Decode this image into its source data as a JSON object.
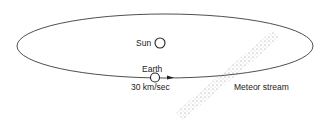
{
  "diagram": {
    "labels": {
      "sun": "Sun",
      "earth": "Earth",
      "earth_speed": "30 km/sec",
      "meteor_stream": "Meteor stream"
    },
    "colors": {
      "line": "#222222",
      "stream_dots": "#777777",
      "background": "#ffffff"
    }
  }
}
